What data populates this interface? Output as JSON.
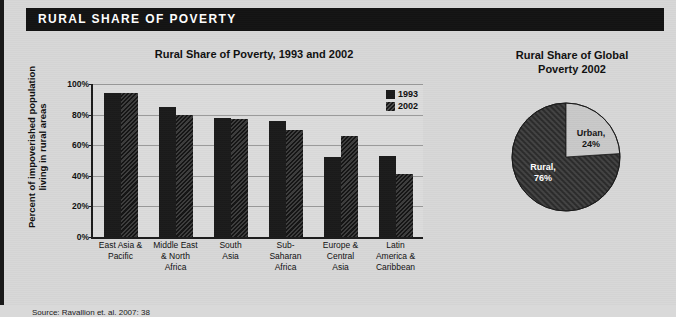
{
  "banner": {
    "title": "RURAL SHARE OF POVERTY",
    "background_color": "#131313",
    "text_color": "#ffffff"
  },
  "source": "Source: Ravallion et. al. 2007: 38",
  "colors": {
    "page_background": "#d8d8d8",
    "series_1993": "#1b1b1b",
    "series_2002": "#2f2f2f",
    "urban_slice": "#c9c9c9",
    "rural_slice": "#333333"
  },
  "chart_data": [
    {
      "type": "bar",
      "title": "Rural Share of Poverty, 1993 and 2002",
      "xlabel": "",
      "ylabel": "Percent of impoverished population living in rural areas",
      "ylim": [
        0,
        100
      ],
      "yticks": [
        "0%",
        "20%",
        "40%",
        "60%",
        "80%",
        "100%"
      ],
      "ytick_values": [
        0,
        20,
        40,
        60,
        80,
        100
      ],
      "grid": true,
      "legend_position": "top-right-inside",
      "categories": [
        "East Asia & Pacific",
        "Middle East & North Africa",
        "South Asia",
        "Sub-Saharan Africa",
        "Europe & Central Asia",
        "Latin America & Caribbean"
      ],
      "category_lines": [
        [
          "East Asia &",
          "Pacific"
        ],
        [
          "Middle East",
          "& North",
          "Africa"
        ],
        [
          "South",
          "Asia"
        ],
        [
          "Sub-",
          "Saharan",
          "Africa"
        ],
        [
          "Europe &",
          "Central",
          "Asia"
        ],
        [
          "Latin",
          "America &",
          "Caribbean"
        ]
      ],
      "series": [
        {
          "name": "1993",
          "values": [
            94,
            85,
            78,
            76,
            52,
            53
          ]
        },
        {
          "name": "2002",
          "values": [
            94,
            80,
            77,
            70,
            66,
            41
          ]
        }
      ]
    },
    {
      "type": "pie",
      "title": "Rural Share of Global Poverty 2002",
      "title_lines": [
        "Rural Share of Global",
        "Poverty 2002"
      ],
      "labels": [
        "Urban",
        "Rural"
      ],
      "values": [
        24,
        76
      ],
      "slice_labels": [
        {
          "line1": "Urban,",
          "line2": "24%"
        },
        {
          "line1": "Rural,",
          "line2": "76%"
        }
      ]
    }
  ]
}
